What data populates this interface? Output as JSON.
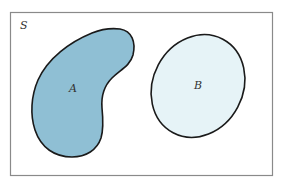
{
  "diagram": {
    "type": "venn",
    "universe": {
      "label": "S",
      "border_color": "#8a8a8a",
      "background": "#ffffff"
    },
    "sets": [
      {
        "label": "A",
        "fill": "#8fbfd4",
        "stroke": "#1a1a1a",
        "shape": "kidney"
      },
      {
        "label": "B",
        "fill": "#e6f3f7",
        "stroke": "#1a1a1a",
        "shape": "ellipse"
      }
    ],
    "relation": "disjoint"
  }
}
